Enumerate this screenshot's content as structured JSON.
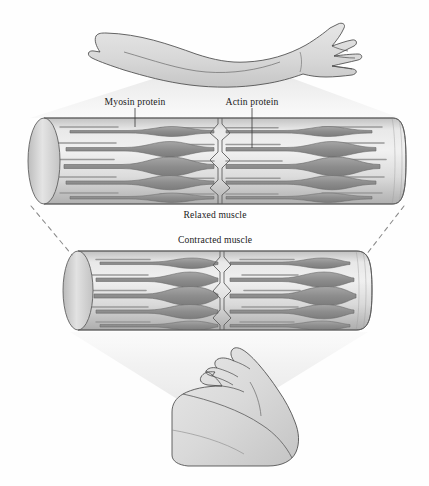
{
  "figure": {
    "labels": {
      "myosin": "Myosin protein",
      "actin": "Actin protein",
      "relaxed": "Relaxed muscle",
      "contracted": "Contracted muscle"
    }
  },
  "icons": {
    "extended_arm": "extended-arm-icon",
    "flexed_arm": "flexed-arm-icon",
    "relaxed_fiber": "relaxed-muscle-fiber-icon",
    "contracted_fiber": "contracted-muscle-fiber-icon",
    "light_cone_top": "magnification-cone-icon",
    "light_cone_bottom": "magnification-cone-icon",
    "zline": "z-line-icon",
    "leader_myosin": "leader-line-icon",
    "leader_actin": "leader-line-icon",
    "dash_left": "dashed-connector-icon",
    "dash_right": "dashed-connector-icon"
  },
  "colors": {
    "background": "#fefefe",
    "outline": "#4a4a4a",
    "skin_fill": "#dcdcdc",
    "skin_shadow": "#c9c9c9",
    "cone": "#ececec",
    "fiber_light": "#e8e8e8",
    "fiber_mid": "#cccccc",
    "fiber_dark": "#a9a9a9",
    "myosin": "#8f8f8f",
    "myosin_edge": "#6e6e6e",
    "actin": "#9a9a9a",
    "cap_fill": "#d5d5d5",
    "text": "#1a1a1a",
    "dashed": "#8a8a8a"
  },
  "geometry": {
    "canvas": {
      "width": 429,
      "height": 486
    },
    "relaxed_fiber": {
      "x": 28,
      "y": 118,
      "width": 378,
      "height": 86,
      "rows": 5,
      "zline_x": 218
    },
    "contracted_fiber": {
      "x": 62,
      "y": 250,
      "width": 312,
      "height": 80,
      "rows": 5,
      "zline_x": 222
    },
    "label_positions": {
      "myosin": {
        "x": 135,
        "y": 103,
        "leader_x": 135,
        "leader_y1": 108,
        "leader_y2": 126
      },
      "actin": {
        "x": 252,
        "y": 103,
        "leader_x": 252,
        "leader_y1": 108,
        "leader_y2": 147
      },
      "relaxed": {
        "x": 215,
        "y": 216
      },
      "contracted": {
        "x": 215,
        "y": 240
      }
    }
  }
}
